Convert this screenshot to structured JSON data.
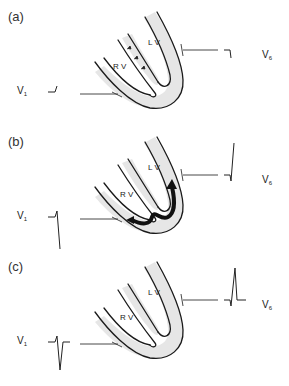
{
  "figure": {
    "panels": [
      {
        "id": "a",
        "label": "(a)",
        "chambers": {
          "left": "L V",
          "right": "R V"
        },
        "leads": {
          "v1": {
            "name": "V",
            "sub": "1"
          },
          "v6": {
            "name": "V",
            "sub": "6"
          }
        },
        "septal_arrows": true,
        "activation_arrow": false,
        "v1_waveform": "small r wave",
        "v6_waveform": "small q wave"
      },
      {
        "id": "b",
        "label": "(b)",
        "chambers": {
          "left": "L V",
          "right": "R V"
        },
        "leads": {
          "v1": {
            "name": "V",
            "sub": "1"
          },
          "v6": {
            "name": "V",
            "sub": "6"
          }
        },
        "septal_arrows": false,
        "activation_arrow": true,
        "v1_waveform": "r then deep S",
        "v6_waveform": "q then tall R"
      },
      {
        "id": "c",
        "label": "(c)",
        "chambers": {
          "left": "L V",
          "right": "R V"
        },
        "leads": {
          "v1": {
            "name": "V",
            "sub": "1"
          },
          "v6": {
            "name": "V",
            "sub": "6"
          }
        },
        "septal_arrows": false,
        "activation_arrow": false,
        "v1_waveform": "complete rS complex",
        "v6_waveform": "complete qRs complex"
      }
    ]
  }
}
